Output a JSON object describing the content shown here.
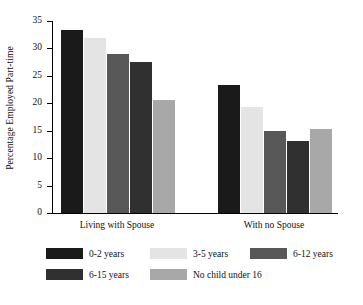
{
  "chart_data": {
    "type": "bar",
    "title": "",
    "xlabel": "",
    "ylabel": "Percentage Employed Part-time",
    "categories": [
      "Living with Spouse",
      "With no Spouse"
    ],
    "series": [
      {
        "name": "0-2 years",
        "color": "#1a1a1a",
        "values": [
          33.3,
          23.3
        ]
      },
      {
        "name": "3-5 years",
        "color": "#e4e4e4",
        "values": [
          31.9,
          19.3
        ]
      },
      {
        "name": "6-12 years",
        "color": "#585858",
        "values": [
          28.9,
          15.0
        ]
      },
      {
        "name": "6-15 years",
        "color": "#303030",
        "values": [
          27.6,
          13.1
        ]
      },
      {
        "name": "No child under 16",
        "color": "#a8a8a8",
        "values": [
          20.6,
          15.4
        ]
      }
    ],
    "ylim": [
      0,
      35
    ],
    "ytick_step": 5,
    "yticks": [
      "35",
      "30",
      "25",
      "20",
      "15",
      "10",
      "5",
      "0"
    ],
    "grid": false,
    "legend_position": "bottom"
  }
}
